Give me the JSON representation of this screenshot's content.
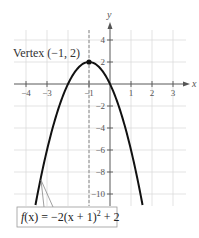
{
  "chart_data": {
    "type": "line",
    "title": "",
    "xlabel": "x",
    "ylabel": "y",
    "xlim": [
      -4.5,
      3.6
    ],
    "ylim": [
      -11,
      5
    ],
    "grid": true,
    "x_ticks": [
      -4,
      -3,
      -1,
      1,
      2,
      3
    ],
    "x_tick_labels": [
      "−4",
      "−3",
      "−1",
      "1",
      "2",
      "3"
    ],
    "y_ticks": [
      4,
      2,
      -2,
      -4,
      -6,
      -8,
      -10
    ],
    "y_tick_labels": [
      "4",
      "2",
      "−2",
      "−4",
      "−6",
      "−8",
      "−10"
    ],
    "series": [
      {
        "name": "f(x) = −2(x + 1)² + 2",
        "equation": "-2*(x+1)^2+2",
        "x": [
          -3.55,
          -3,
          -2.5,
          -2,
          -1.5,
          -1,
          -0.5,
          0,
          0.5,
          1.55
        ],
        "y": [
          -11,
          -6,
          -2.5,
          0,
          1.5,
          2,
          1.5,
          0,
          -2.5,
          -11
        ]
      }
    ],
    "annotations": [
      {
        "text": "Vertex (−1, 2)",
        "x": -1,
        "y": 2,
        "type": "point"
      },
      {
        "text": "x = −1",
        "type": "dashed-vertical-line",
        "x": -1
      },
      {
        "text": "f(x) = −2(x + 1)² + 2",
        "type": "callout-box"
      }
    ]
  },
  "labels": {
    "x_axis": "x",
    "y_axis": "y",
    "vertex": "Vertex (−1, 2)",
    "function_prefix": "f(x) = −2(x + 1)",
    "function_exp": "2",
    "function_suffix": " + 2"
  },
  "colors": {
    "curve": "#111111",
    "grid": "#dcdcdc",
    "axis": "#666666",
    "dashed_line": "#888888"
  }
}
